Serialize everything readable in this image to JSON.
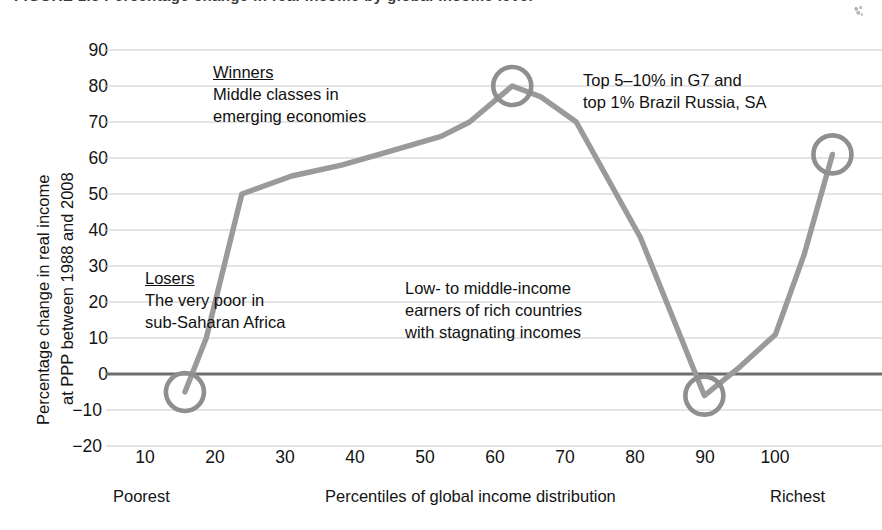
{
  "figure": {
    "caption_partial": "FIGURE 1.3  Percentage change in real income by global income level"
  },
  "axes": {
    "y_title_line1": "Percentage change in real income",
    "y_title_line2": "at PPP between 1988 and 2008",
    "x_title": "Percentiles of global income distribution",
    "x_end_left": "Poorest",
    "x_end_right": "Richest",
    "y_ticks": [
      "90",
      "80",
      "70",
      "60",
      "50",
      "40",
      "30",
      "20",
      "10",
      "0",
      "−10",
      "−20"
    ],
    "x_ticks": [
      "10",
      "20",
      "30",
      "40",
      "50",
      "60",
      "70",
      "80",
      "90",
      "100"
    ]
  },
  "annotations": {
    "winners": {
      "heading": "Winners",
      "line1": "Middle classes in",
      "line2": "emerging economies"
    },
    "losers": {
      "heading": "Losers",
      "line1": "The very poor in",
      "line2": "sub-Saharan Africa"
    },
    "rich_top": {
      "line1": "Top 5–10% in G7 and",
      "line2": "top 1% Brazil Russia, SA"
    },
    "low_middle": {
      "line1": "Low- to middle-income",
      "line2": "earners of rich countries",
      "line3": "with stagnating incomes"
    }
  },
  "colors": {
    "line": "#9a9a9a",
    "marker": "#8f8f8f",
    "grid": "#c9c9c9",
    "zero_line": "#6e6e6e",
    "text": "#141414",
    "background": "#ffffff"
  },
  "chart_data": {
    "type": "line",
    "xlabel": "Percentiles of global income distribution",
    "ylabel": "Percentage change in real income at PPP between 1988 and 2008",
    "xlim": [
      0,
      104
    ],
    "ylim": [
      -20,
      90
    ],
    "grid": true,
    "legend": "none",
    "x": [
      8,
      11,
      16,
      23,
      30,
      37,
      44,
      48,
      54,
      58,
      63,
      72,
      81,
      86,
      91,
      95,
      99
    ],
    "y": [
      -5,
      10,
      50,
      55,
      58,
      62,
      66,
      70,
      80,
      77,
      70,
      38,
      -6,
      2,
      11,
      33,
      61
    ],
    "series": [
      {
        "name": "Percentage change in real income at PPP, 1988–2008",
        "values": [
          -5,
          10,
          50,
          55,
          58,
          62,
          66,
          70,
          80,
          77,
          70,
          38,
          -6,
          2,
          11,
          33,
          61
        ]
      }
    ],
    "markers": [
      {
        "label": "Losers – the very poor in sub-Saharan Africa",
        "x": 8,
        "y": -5
      },
      {
        "label": "Winners – middle classes in emerging economies",
        "x": 54,
        "y": 80
      },
      {
        "label": "Low- to middle-income earners of rich countries",
        "x": 81,
        "y": -6
      },
      {
        "label": "Top 5–10% in G7 and top 1% Brazil Russia, SA",
        "x": 99,
        "y": 61
      }
    ],
    "y_ticks": [
      -20,
      -10,
      0,
      10,
      20,
      30,
      40,
      50,
      60,
      70,
      80,
      90
    ],
    "x_ticks": [
      10,
      20,
      30,
      40,
      50,
      60,
      70,
      80,
      90,
      100
    ],
    "zero_reference_line": 0
  }
}
